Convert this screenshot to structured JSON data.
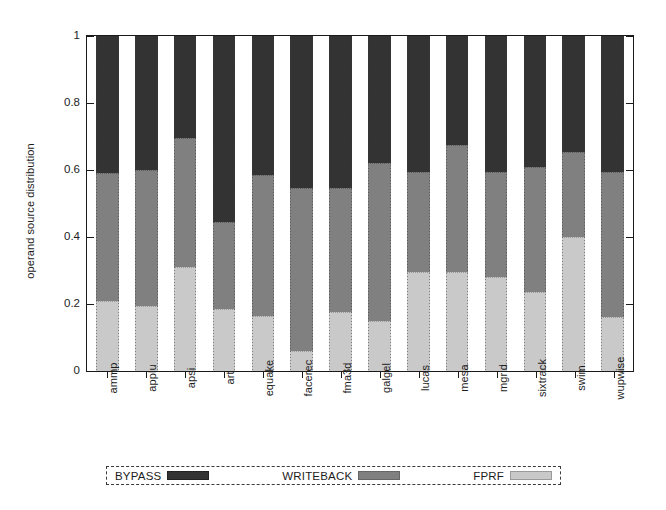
{
  "chart_data": {
    "type": "bar",
    "subtype": "stacked-bar-100",
    "title": "",
    "xlabel": "",
    "ylabel": "operand source distribution",
    "ylim": [
      0,
      1
    ],
    "yticks": [
      "0",
      "0.2",
      "0.4",
      "0.6",
      "0.8",
      "1"
    ],
    "ytick_values": [
      0,
      0.2,
      0.4,
      0.6,
      0.8,
      1
    ],
    "grid": false,
    "legend_position": "bottom",
    "categories": [
      "ammp",
      "applu",
      "apsi",
      "art",
      "equake",
      "facerec",
      "fma3d",
      "galgel",
      "lucas",
      "mesa",
      "mgrid",
      "sixtrack",
      "swim",
      "wupwise"
    ],
    "series": [
      {
        "name": "FPRF",
        "color": "#c9c9c9",
        "values": [
          0.21,
          0.195,
          0.31,
          0.185,
          0.165,
          0.06,
          0.175,
          0.15,
          0.295,
          0.295,
          0.28,
          0.235,
          0.4,
          0.16
        ]
      },
      {
        "name": "WRITEBACK",
        "color": "#808080",
        "values": [
          0.38,
          0.405,
          0.385,
          0.26,
          0.42,
          0.485,
          0.37,
          0.47,
          0.3,
          0.38,
          0.315,
          0.375,
          0.255,
          0.435
        ]
      },
      {
        "name": "BYPASS",
        "color": "#333333",
        "values": [
          0.41,
          0.4,
          0.305,
          0.555,
          0.415,
          0.455,
          0.455,
          0.38,
          0.405,
          0.325,
          0.405,
          0.39,
          0.345,
          0.405
        ]
      }
    ],
    "cumulative_boundaries": {
      "note": "top of FPRF then top of WRITEBACK, as fractions of 1",
      "ammp": [
        0.21,
        0.59
      ],
      "applu": [
        0.195,
        0.6
      ],
      "apsi": [
        0.31,
        0.695
      ],
      "art": [
        0.185,
        0.445
      ],
      "equake": [
        0.165,
        0.585
      ],
      "facerec": [
        0.06,
        0.545
      ],
      "fma3d": [
        0.175,
        0.545
      ],
      "galgel": [
        0.15,
        0.62
      ],
      "lucas": [
        0.295,
        0.595
      ],
      "mesa": [
        0.295,
        0.675
      ],
      "mgrid": [
        0.28,
        0.595
      ],
      "sixtrack": [
        0.235,
        0.61
      ],
      "swim": [
        0.4,
        0.655
      ],
      "wupwise": [
        0.16,
        0.595
      ]
    }
  },
  "legend": {
    "entries": [
      {
        "label": "BYPASS",
        "swatch": "sw-bypass"
      },
      {
        "label": "WRITEBACK",
        "swatch": "sw-writeback"
      },
      {
        "label": "FPRF",
        "swatch": "sw-fprf"
      }
    ]
  }
}
